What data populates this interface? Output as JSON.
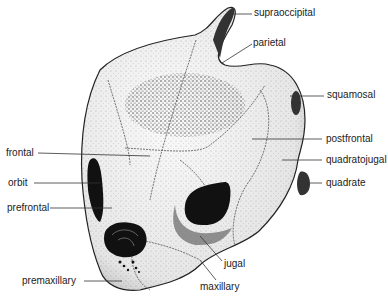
{
  "figure": {
    "colors": {
      "bone": "#f2f2f2",
      "stipple": "#444444",
      "cavity": "#111111",
      "leader": "#333333"
    }
  },
  "labels": {
    "supraoccipital": "supraoccipital",
    "parietal": "parietal",
    "squamosal": "squamosal",
    "postfrontal": "postfrontal",
    "quadratojugal": "quadratojugal",
    "quadrate": "quadrate",
    "frontal": "frontal",
    "orbit": "orbit",
    "prefrontal": "prefrontal",
    "jugal": "jugal",
    "premaxillary": "premaxillary",
    "maxillary": "maxillary"
  }
}
